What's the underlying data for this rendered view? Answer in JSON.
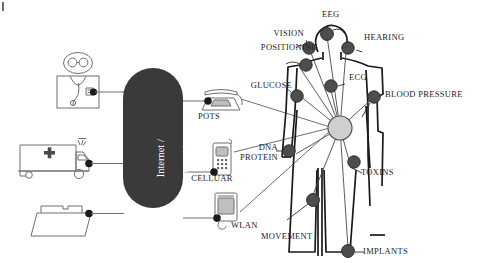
{
  "figure": {
    "corner_mark": "page-edge-artifact"
  },
  "colors": {
    "sensor_dot": "#4d4d4d",
    "sensor_dot_edge": "#2b2b2b",
    "hub": "#c9c9c9",
    "hub_edge": "#555555",
    "network_cloud": "#3a3a3a",
    "network_text": "#ffffff",
    "outline": "#5a5a5a",
    "body_outline": "#1a1a1a",
    "link_line": "#6f6f6f",
    "leader_line": "#3a3a3a",
    "background": "#ffffff"
  },
  "network": {
    "label_line1": "Internet /",
    "label_line2": "Wide Area Network"
  },
  "endpoints": [
    {
      "name": "doctor",
      "label": "",
      "icon": "doctor-icon"
    },
    {
      "name": "ambulance",
      "label": "",
      "icon": "ambulance-icon"
    },
    {
      "name": "records",
      "label": "",
      "icon": "folder-icon"
    }
  ],
  "access_devices": [
    {
      "name": "pots",
      "label": "POTS",
      "icon": "desk-phone-icon"
    },
    {
      "name": "cellular",
      "label": "CELLUAR",
      "icon": "mobile-phone-icon"
    },
    {
      "name": "wlan",
      "label": "WLAN",
      "icon": "wlan-device-icon"
    }
  ],
  "body_sensors": [
    {
      "name": "eeg",
      "label": "EEG"
    },
    {
      "name": "vision",
      "label": "VISION"
    },
    {
      "name": "hearing",
      "label": "HEARING"
    },
    {
      "name": "positioning",
      "label": "POSITIONING"
    },
    {
      "name": "glucose",
      "label": "GLUCOSE"
    },
    {
      "name": "ecg",
      "label": "ECG"
    },
    {
      "name": "blood-pressure",
      "label": "BLOOD PRESSURE"
    },
    {
      "name": "dna-protein",
      "label_line1": "DNA",
      "label_line2": "PROTEIN"
    },
    {
      "name": "toxins",
      "label": "TOXINS"
    },
    {
      "name": "movement",
      "label": "MOVEMENT"
    },
    {
      "name": "implants",
      "label": "IMPLANTS"
    }
  ]
}
